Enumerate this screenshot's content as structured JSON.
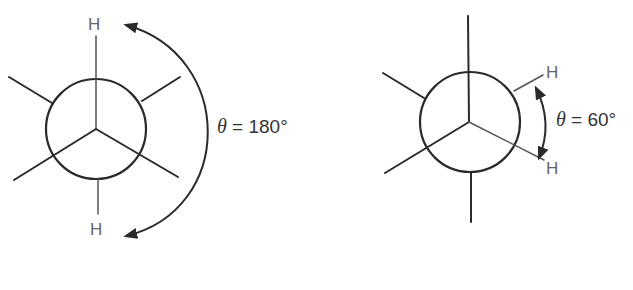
{
  "figure": {
    "type": "Newman projections",
    "left": {
      "atom_top": "H",
      "atom_bottom": "H",
      "theta_symbol": "θ",
      "angle_label": " = 180°"
    },
    "right": {
      "atom_upper_right": "H",
      "atom_lower_right": "H",
      "theta_symbol": "θ",
      "angle_label": " = 60°"
    }
  }
}
